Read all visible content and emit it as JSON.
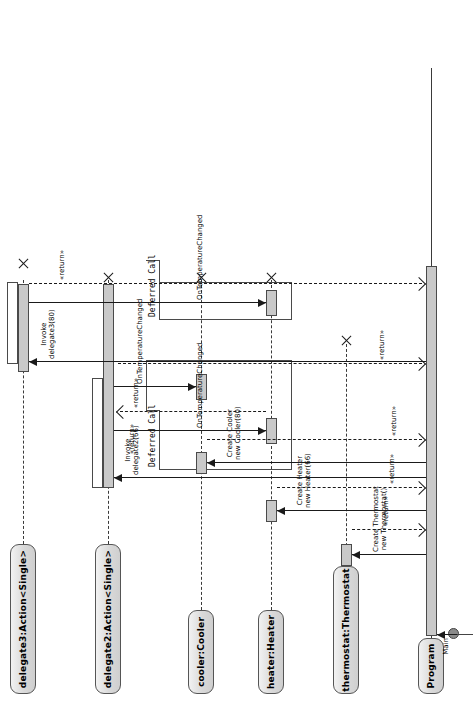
{
  "diagram": {
    "type": "uml-sequence-diagram",
    "orientation": "rotated-90-ccw",
    "title": "",
    "colors": {
      "lifeline_head_fill": "#d9d9d9",
      "activation_fill": "#c9c9c9",
      "line": "#1a1a1a",
      "border": "#4a4a4a",
      "background": "#ffffff"
    }
  },
  "lifelines": [
    {
      "id": "program",
      "label": "Program"
    },
    {
      "id": "thermostat",
      "label": "thermostat:Thermostat"
    },
    {
      "id": "heater",
      "label": "heater:Heater"
    },
    {
      "id": "cooler",
      "label": "cooler:Cooler"
    },
    {
      "id": "delegate2",
      "label": "delegate2:Action<Single>"
    },
    {
      "id": "delegate3",
      "label": "delegate3:Action<Single>"
    }
  ],
  "actor": {
    "label": "Main"
  },
  "messages": [
    {
      "id": "m-main",
      "from": "actor",
      "to": "program",
      "kind": "call",
      "label": "Main"
    },
    {
      "id": "m-create-thermostat",
      "from": "program",
      "to": "thermostat",
      "kind": "create",
      "label_line1": "Create Thermostat",
      "label_line2": "new Thermostat()"
    },
    {
      "id": "m-return-thermostat",
      "from": "thermostat",
      "to": "program",
      "kind": "return",
      "label": "«return»"
    },
    {
      "id": "m-create-heater",
      "from": "program",
      "to": "heater",
      "kind": "create",
      "label_line1": "Create Heater",
      "label_line2": "new Heater(66)"
    },
    {
      "id": "m-return-heater",
      "from": "heater",
      "to": "program",
      "kind": "return",
      "label": "«return»"
    },
    {
      "id": "m-create-cooler",
      "from": "program",
      "to": "cooler",
      "kind": "create",
      "label_line1": "Create Cooler",
      "label_line2": "new Cooler(80)"
    },
    {
      "id": "m-return-cooler",
      "from": "cooler",
      "to": "program",
      "kind": "return",
      "label": "«return»"
    },
    {
      "id": "m-invoke-delegate2",
      "from": "program",
      "to": "delegate2",
      "kind": "call",
      "label_line1": "Invoke",
      "label_line2": "delegate2(66)"
    },
    {
      "id": "m-ontempchanged-heater",
      "from": "delegate2",
      "to": "heater",
      "kind": "call",
      "label": "OnTemperatureChanged"
    },
    {
      "id": "m-return-ontempchanged-heater",
      "from": "heater",
      "to": "delegate2",
      "kind": "return",
      "label": "«return»"
    },
    {
      "id": "m-ontempchanged-cooler",
      "from": "delegate2",
      "to": "cooler",
      "kind": "call",
      "label": "OnTemperatureChanged"
    },
    {
      "id": "m-return-ontempchanged-cooler",
      "from": "cooler",
      "to": "delegate2",
      "kind": "return",
      "label": "«return»"
    },
    {
      "id": "m-return-delegate2",
      "from": "delegate2",
      "to": "program",
      "kind": "return",
      "label": "«return»"
    },
    {
      "id": "m-invoke-delegate3",
      "from": "program",
      "to": "delegate3",
      "kind": "call",
      "label_line1": "Invoke",
      "label_line2": "delegate3(80)"
    },
    {
      "id": "m-ontempchanged-cooler2",
      "from": "delegate3",
      "to": "cooler",
      "kind": "call",
      "label": "OnTemperatureChanged"
    },
    {
      "id": "m-return-delegate3",
      "from": "delegate3",
      "to": "program",
      "kind": "return",
      "label": "«return»"
    }
  ],
  "fragments": [
    {
      "id": "deferred-1",
      "operator": "Deferred Call"
    },
    {
      "id": "deferred-2",
      "operator": "Deferred Call"
    }
  ],
  "destructions": [
    {
      "id": "destroy-thermostat",
      "lifeline": "thermostat"
    },
    {
      "id": "destroy-heater",
      "lifeline": "heater"
    },
    {
      "id": "destroy-cooler",
      "lifeline": "cooler"
    },
    {
      "id": "destroy-delegate2",
      "lifeline": "delegate2"
    },
    {
      "id": "destroy-delegate3",
      "lifeline": "delegate3"
    }
  ]
}
